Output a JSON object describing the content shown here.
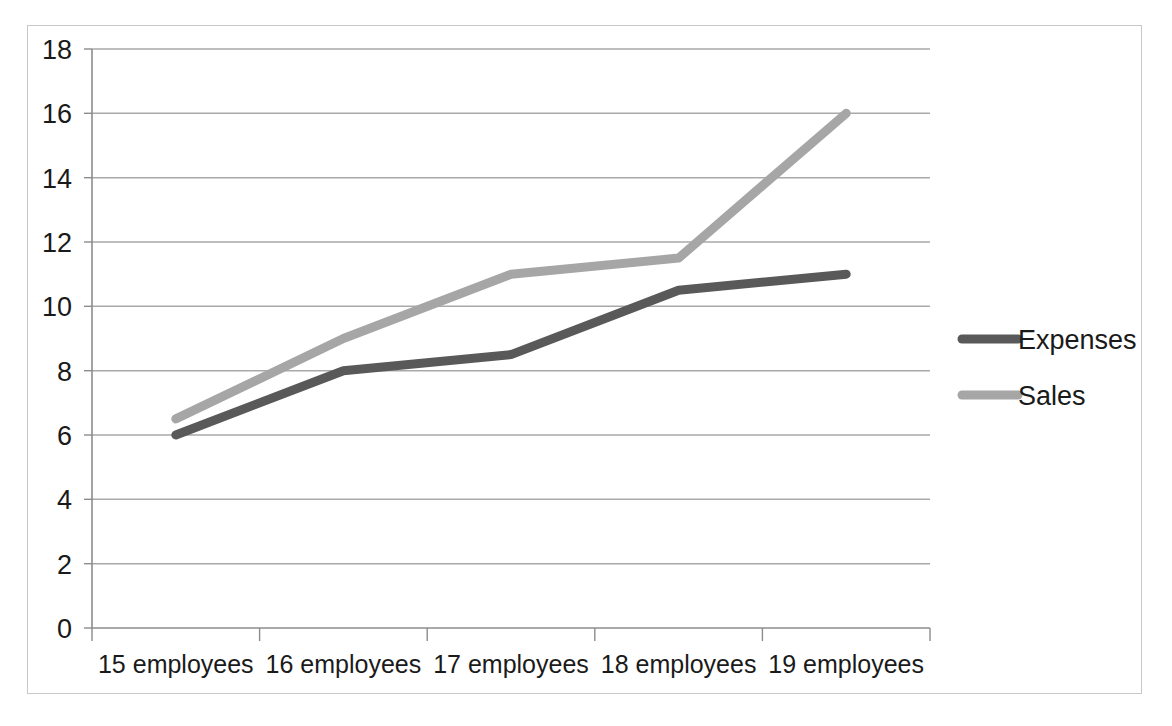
{
  "chart_data": {
    "type": "line",
    "title": "",
    "subtitle": "",
    "xlabel": "",
    "ylabel": "",
    "categories": [
      "15 employees",
      "16 employees",
      "17 employees",
      "18 employees",
      "19 employees"
    ],
    "series": [
      {
        "name": "Expenses",
        "values": [
          6,
          8,
          8.5,
          10.5,
          11
        ],
        "color": "#595959"
      },
      {
        "name": "Sales",
        "values": [
          6.5,
          9,
          11,
          11.5,
          16
        ],
        "color": "#a6a6a6"
      }
    ],
    "ylim": [
      0,
      18
    ],
    "ytick_labels": [
      "0",
      "2",
      "4",
      "6",
      "8",
      "10",
      "12",
      "14",
      "16",
      "18"
    ],
    "ytick_values": [
      0,
      2,
      4,
      6,
      8,
      10,
      12,
      14,
      16,
      18
    ],
    "grid": true,
    "grid_axis": "y",
    "legend_position": "right",
    "legend_entries": [
      "Expenses",
      "Sales"
    ],
    "plot_background": "#ffffff",
    "border_color": "#c8c8c8",
    "gridline_color": "#a9a9a9"
  }
}
